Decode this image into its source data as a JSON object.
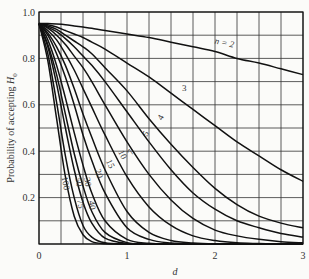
{
  "chart_data": {
    "type": "line",
    "title": "",
    "xlabel": "d",
    "ylabel": "Probability of accepting H",
    "ylabel_subscript": "0",
    "xlim": [
      0,
      3
    ],
    "ylim": [
      0,
      1.0
    ],
    "x_ticks": [
      0,
      1,
      2,
      3
    ],
    "x_tick_labels": [
      "0",
      "1",
      "2",
      "3"
    ],
    "y_ticks": [
      0.2,
      0.4,
      0.6,
      0.8,
      1.0
    ],
    "y_tick_labels": [
      "0.2",
      "0.4",
      "0.6",
      "0.8",
      "1.0"
    ],
    "origin_label": "0",
    "grid": {
      "on": true,
      "x_step": 0.25,
      "y_step": 0.1
    },
    "legend": "inline curve labels",
    "x": [
      0,
      0.1,
      0.2,
      0.3,
      0.4,
      0.5,
      0.6,
      0.75,
      1.0,
      1.25,
      1.5,
      1.75,
      2.0,
      2.25,
      2.5,
      2.75,
      3.0
    ],
    "series": [
      {
        "name": "n = 2",
        "label": "n = 2",
        "values": [
          0.95,
          0.95,
          0.948,
          0.945,
          0.94,
          0.935,
          0.93,
          0.92,
          0.905,
          0.89,
          0.87,
          0.85,
          0.83,
          0.8,
          0.78,
          0.755,
          0.73
        ]
      },
      {
        "name": "n = 3",
        "label": "3",
        "values": [
          0.95,
          0.945,
          0.935,
          0.92,
          0.905,
          0.89,
          0.87,
          0.84,
          0.78,
          0.72,
          0.65,
          0.58,
          0.51,
          0.44,
          0.38,
          0.32,
          0.27
        ]
      },
      {
        "name": "n = 4",
        "label": "4",
        "values": [
          0.95,
          0.94,
          0.925,
          0.9,
          0.875,
          0.85,
          0.82,
          0.76,
          0.66,
          0.54,
          0.43,
          0.33,
          0.24,
          0.17,
          0.12,
          0.09,
          0.07
        ]
      },
      {
        "name": "n = 5",
        "label": "5",
        "values": [
          0.95,
          0.935,
          0.915,
          0.885,
          0.85,
          0.81,
          0.77,
          0.7,
          0.57,
          0.44,
          0.32,
          0.22,
          0.15,
          0.1,
          0.07,
          0.045,
          0.03
        ]
      },
      {
        "name": "n = 7",
        "label": "7",
        "values": [
          0.95,
          0.93,
          0.9,
          0.86,
          0.81,
          0.76,
          0.7,
          0.6,
          0.44,
          0.3,
          0.19,
          0.11,
          0.06,
          0.035,
          0.02,
          0.01,
          0.005
        ]
      },
      {
        "name": "n = 10",
        "label": "10",
        "values": [
          0.95,
          0.92,
          0.88,
          0.82,
          0.75,
          0.67,
          0.59,
          0.47,
          0.29,
          0.16,
          0.08,
          0.035,
          0.015,
          0.005,
          0.002,
          0,
          0
        ]
      },
      {
        "name": "n = 15",
        "label": "15",
        "values": [
          0.95,
          0.91,
          0.85,
          0.77,
          0.67,
          0.56,
          0.46,
          0.32,
          0.14,
          0.05,
          0.015,
          0.004,
          0,
          0,
          0,
          0,
          0
        ]
      },
      {
        "name": "n = 20",
        "label": "20",
        "values": [
          0.95,
          0.9,
          0.82,
          0.72,
          0.6,
          0.47,
          0.36,
          0.22,
          0.07,
          0.02,
          0.004,
          0,
          0,
          0,
          0,
          0,
          0
        ]
      },
      {
        "name": "n = 30",
        "label": "30",
        "values": [
          0.95,
          0.88,
          0.77,
          0.63,
          0.48,
          0.34,
          0.22,
          0.1,
          0.02,
          0.003,
          0,
          0,
          0,
          0,
          0,
          0,
          0
        ]
      },
      {
        "name": "n = 40",
        "label": "40",
        "values": [
          0.95,
          0.86,
          0.73,
          0.56,
          0.39,
          0.25,
          0.14,
          0.05,
          0.006,
          0,
          0,
          0,
          0,
          0,
          0,
          0,
          0
        ]
      },
      {
        "name": "n = 50",
        "label": "50",
        "values": [
          0.95,
          0.85,
          0.69,
          0.5,
          0.32,
          0.18,
          0.09,
          0.025,
          0.002,
          0,
          0,
          0,
          0,
          0,
          0,
          0,
          0
        ]
      },
      {
        "name": "n = 75",
        "label": "75",
        "values": [
          0.95,
          0.82,
          0.61,
          0.38,
          0.2,
          0.08,
          0.03,
          0.005,
          0,
          0,
          0,
          0,
          0,
          0,
          0,
          0,
          0
        ]
      },
      {
        "name": "n = 100",
        "label": "100",
        "values": [
          0.95,
          0.79,
          0.54,
          0.29,
          0.12,
          0.04,
          0.01,
          0.001,
          0,
          0,
          0,
          0,
          0,
          0,
          0,
          0,
          0
        ]
      }
    ],
    "label_positions": [
      {
        "label": "n = 2",
        "d": 2.1,
        "p": 0.855,
        "rot": 12
      },
      {
        "label": "3",
        "d": 1.65,
        "p": 0.66,
        "rot": 0
      },
      {
        "label": "4",
        "d": 1.41,
        "p": 0.54,
        "rot": -60
      },
      {
        "label": "5",
        "d": 1.24,
        "p": 0.47,
        "rot": -60
      },
      {
        "label": "7",
        "d": 1.07,
        "p": 0.39,
        "rot": -60
      },
      {
        "label": "10",
        "d": 0.92,
        "p": 0.38,
        "rot": 65
      },
      {
        "label": "15",
        "d": 0.78,
        "p": 0.34,
        "rot": 65
      },
      {
        "label": "20",
        "d": 0.65,
        "p": 0.3,
        "rot": 72
      },
      {
        "label": "30",
        "d": 0.52,
        "p": 0.265,
        "rot": 80
      },
      {
        "label": "40",
        "d": 0.57,
        "p": 0.165,
        "rot": 80
      },
      {
        "label": "50",
        "d": 0.42,
        "p": 0.265,
        "rot": 80
      },
      {
        "label": "75",
        "d": 0.44,
        "p": 0.17,
        "rot": 80
      },
      {
        "label": "100",
        "d": 0.27,
        "p": 0.26,
        "rot": 80
      }
    ]
  },
  "colors": {
    "background": "#fbfbf9",
    "line": "#111111",
    "grid": "#333333",
    "text": "#333333"
  }
}
